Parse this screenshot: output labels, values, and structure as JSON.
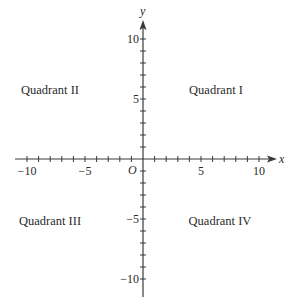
{
  "diagram": {
    "type": "coordinate-plane",
    "colors": {
      "axis": "#3a3a3a",
      "text": "#2a2a2a",
      "background": "#ffffff"
    },
    "axes": {
      "x": {
        "label": "x",
        "min": -10,
        "max": 10,
        "ticks_every": 1,
        "labeled_ticks": [
          "-10",
          "-5",
          "5",
          "10"
        ]
      },
      "y": {
        "label": "y",
        "min": -10,
        "max": 10,
        "ticks_every": 1,
        "labeled_ticks": [
          "10",
          "5",
          "-5",
          "-10"
        ]
      },
      "origin_label": "O"
    },
    "tick_labels": {
      "x_neg10": "−10",
      "x_neg5": "−5",
      "x_5": "5",
      "x_10": "10",
      "y_10": "10",
      "y_5": "5",
      "y_neg5": "−5",
      "y_neg10": "−10"
    },
    "quadrants": {
      "q1": "Quadrant I",
      "q2": "Quadrant II",
      "q3": "Quadrant III",
      "q4": "Quadrant IV"
    }
  }
}
